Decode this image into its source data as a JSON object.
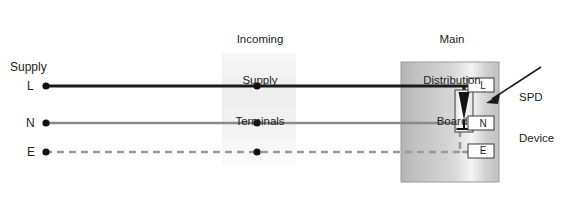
{
  "diagram": {
    "title_labels": {
      "incoming_supply_terminals": "Incoming\nSupply\nTerminals",
      "incoming_line1": "Incoming",
      "incoming_line2": "Supply",
      "incoming_line3": "Terminals",
      "main_distribution_board": "Main\nDistribution\nBoard",
      "mdb_line1": "Main",
      "mdb_line2": "Distribution",
      "mdb_line3": "Board",
      "spd_device": "SPD\nDevice",
      "spd_line1": "SPD",
      "spd_line2": "Device"
    },
    "supply": {
      "group_label": "Supply",
      "conductors": [
        {
          "label": "L",
          "name": "live",
          "style": "solid",
          "color": "#1a1a1a",
          "y": 86
        },
        {
          "label": "N",
          "name": "neutral",
          "style": "solid",
          "color": "#8a8a8a",
          "y": 123
        },
        {
          "label": "E",
          "name": "earth",
          "style": "dashed",
          "color": "#9a9a9a",
          "y": 152
        }
      ]
    },
    "board_terminals": [
      {
        "label": "L",
        "name": "terminal-live"
      },
      {
        "label": "N",
        "name": "terminal-neutral"
      },
      {
        "label": "E",
        "name": "terminal-earth"
      }
    ],
    "colors": {
      "line_live": "#1a1a1a",
      "line_neutral": "#8a8a8a",
      "line_earth": "#9a9a9a",
      "board_fill_left": "#b8b8b8",
      "board_fill_mid": "#f2f2f2",
      "board_fill_right": "#c9c9c9",
      "board_stroke": "#8f8f8f",
      "terminal_band": "#eeeeee",
      "text": "#231f20",
      "terminal_box_fill": "#ffffff",
      "terminal_box_stroke": "#3a3a3a",
      "spd_body_fill": "#f5f5f5",
      "spd_symbol_fill": "#1a1a1a",
      "arrow": "#1a1a1a"
    },
    "geometry": {
      "terminal_band_x": 222,
      "terminal_band_width": 74,
      "board_x": 401,
      "board_y": 62,
      "board_width": 98,
      "board_height": 120,
      "junction_dot_x": 257
    }
  }
}
